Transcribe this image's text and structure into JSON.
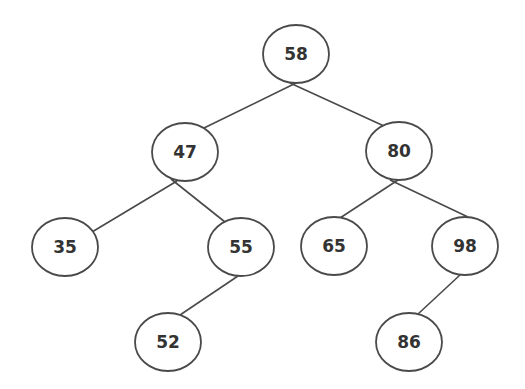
{
  "diagram": {
    "type": "binary-search-tree",
    "colors": {
      "stroke": "#4a4a4a",
      "text": "#333333",
      "fill": "#ffffff",
      "background": "#ffffff"
    },
    "node_rx": 33,
    "node_ry": 29,
    "nodes": [
      {
        "id": "n58",
        "label": "58",
        "cx": 296,
        "cy": 54
      },
      {
        "id": "n47",
        "label": "47",
        "cx": 185,
        "cy": 152
      },
      {
        "id": "n80",
        "label": "80",
        "cx": 399,
        "cy": 151
      },
      {
        "id": "n35",
        "label": "35",
        "cx": 65,
        "cy": 247
      },
      {
        "id": "n55",
        "label": "55",
        "cx": 241,
        "cy": 247
      },
      {
        "id": "n65",
        "label": "65",
        "cx": 334,
        "cy": 246
      },
      {
        "id": "n98",
        "label": "98",
        "cx": 465,
        "cy": 246
      },
      {
        "id": "n52",
        "label": "52",
        "cx": 168,
        "cy": 342
      },
      {
        "id": "n86",
        "label": "86",
        "cx": 409,
        "cy": 342
      }
    ],
    "edges": [
      {
        "from": "n58",
        "to": "n47",
        "x1": 296,
        "y1": 83,
        "x2": 204,
        "y2": 128
      },
      {
        "from": "n58",
        "to": "n80",
        "x1": 290,
        "y1": 83,
        "x2": 384,
        "y2": 126
      },
      {
        "from": "n47",
        "to": "n35",
        "x1": 177,
        "y1": 181,
        "x2": 92,
        "y2": 232
      },
      {
        "from": "n47",
        "to": "n55",
        "x1": 171,
        "y1": 179,
        "x2": 225,
        "y2": 222
      },
      {
        "from": "n80",
        "to": "n65",
        "x1": 398,
        "y1": 180,
        "x2": 340,
        "y2": 218
      },
      {
        "from": "n80",
        "to": "n98",
        "x1": 390,
        "y1": 180,
        "x2": 468,
        "y2": 217
      },
      {
        "from": "n55",
        "to": "n52",
        "x1": 238,
        "y1": 276,
        "x2": 180,
        "y2": 315
      },
      {
        "from": "n98",
        "to": "n86",
        "x1": 460,
        "y1": 275,
        "x2": 418,
        "y2": 314
      }
    ]
  }
}
